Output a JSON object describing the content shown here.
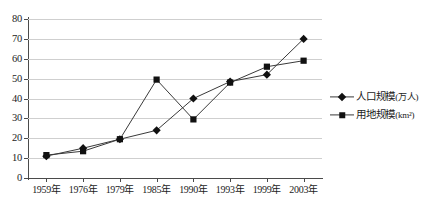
{
  "chart_data": {
    "type": "line",
    "title": "",
    "xlabel": "",
    "ylabel": "",
    "ylim": [
      0,
      80
    ],
    "ytick_step": 10,
    "grid": true,
    "legend_position": "right",
    "categories": [
      "1959年",
      "1976年",
      "1979年",
      "1985年",
      "1990年",
      "1993年",
      "1999年",
      "2003年"
    ],
    "ytick_labels": [
      "0",
      "10",
      "20",
      "30",
      "40",
      "50",
      "60",
      "70",
      "80"
    ],
    "series": [
      {
        "name": "人口规模(万人)",
        "marker": "diamond",
        "values": [
          11,
          15,
          19.5,
          24,
          40,
          48.5,
          52,
          70
        ]
      },
      {
        "name": "用地规模(km²)",
        "marker": "square",
        "values": [
          11.5,
          13.5,
          19.5,
          49.5,
          29.5,
          48,
          56,
          59
        ]
      }
    ]
  },
  "legend": {
    "entries": [
      {
        "label": "人口规模(万人)",
        "marker": "diamond-marker"
      },
      {
        "label": "用地规模(km²)",
        "marker": "square-marker"
      }
    ]
  },
  "colors": {
    "series_line": "#3a3a3a",
    "marker": "#111111",
    "gridline": "#cfcfcf",
    "axis": "#4a4a4a",
    "text": "#1c1c1c"
  },
  "caption": {
    "text": ""
  }
}
